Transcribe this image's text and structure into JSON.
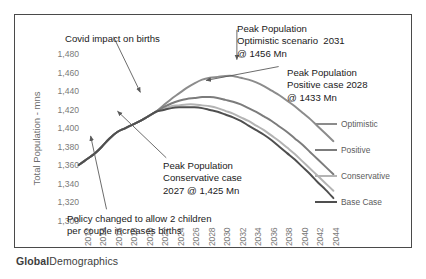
{
  "brand": {
    "bold": "Global",
    "regular": "Demographics"
  },
  "axes": {
    "y_title": "Total Population - mns",
    "y_ticks": [
      "1,480",
      "1,460",
      "1,440",
      "1,420",
      "1,400",
      "1,380",
      "1,360",
      "1,340",
      "1,320",
      "1,300"
    ],
    "x_ticks": [
      "2012",
      "2014",
      "2016",
      "2018",
      "2020",
      "2022",
      "2024",
      "2026",
      "2028",
      "2030",
      "2032",
      "2034",
      "2036",
      "2038",
      "2040",
      "2042",
      "2044"
    ]
  },
  "annotations": {
    "covid": "Covid impact on births",
    "optimistic": "Peak Population\nOptimistic scenario  2031\n@ 1456 Mn",
    "positive": "Peak Population\nPositive case 2028\n@ 1433 Mn",
    "conservative": "Peak Population\nConservative case\n2027 @ 1,425 Mn",
    "policy": "Policy changed to allow 2 children\nper couple increases births"
  },
  "legend": [
    {
      "label": "Optimistic",
      "color": "#8c8c8c"
    },
    {
      "label": "Positive",
      "color": "#7c7c7c"
    },
    {
      "label": "Conservative",
      "color": "#b4b4b4"
    },
    {
      "label": "Base Case",
      "color": "#4f4f4f"
    }
  ],
  "chart_data": {
    "type": "line",
    "title": "",
    "xlabel": "",
    "ylabel": "Total Population - mns",
    "xlim": [
      2012,
      2045
    ],
    "ylim": [
      1300,
      1490
    ],
    "grid": false,
    "legend_position": "right",
    "x": [
      2012,
      2013,
      2014,
      2015,
      2016,
      2017,
      2018,
      2019,
      2020,
      2021,
      2022,
      2023,
      2024,
      2025,
      2026,
      2027,
      2028,
      2029,
      2030,
      2031,
      2032,
      2033,
      2034,
      2035,
      2036,
      2037,
      2038,
      2039,
      2040,
      2041,
      2042,
      2043,
      2044,
      2045
    ],
    "series": [
      {
        "name": "Optimistic",
        "color": "#8c8c8c",
        "values": [
          1359,
          1365,
          1371,
          1379,
          1388,
          1395,
          1399,
          1403,
          1407,
          1412,
          1417,
          1424,
          1431,
          1437,
          1443,
          1448,
          1452,
          1454,
          1455,
          1456,
          1456,
          1454,
          1452,
          1449,
          1445,
          1440,
          1435,
          1429,
          1423,
          1416,
          1409,
          1401,
          1393,
          1385
        ]
      },
      {
        "name": "Positive",
        "color": "#7c7c7c",
        "values": [
          1359,
          1365,
          1371,
          1379,
          1388,
          1395,
          1399,
          1403,
          1407,
          1412,
          1417,
          1422,
          1426,
          1429,
          1431,
          1432,
          1433,
          1433,
          1432,
          1430,
          1428,
          1425,
          1421,
          1417,
          1412,
          1407,
          1401,
          1395,
          1388,
          1381,
          1373,
          1365,
          1357,
          1349
        ]
      },
      {
        "name": "Conservative",
        "color": "#b4b4b4",
        "values": [
          1359,
          1365,
          1371,
          1379,
          1388,
          1395,
          1399,
          1403,
          1407,
          1412,
          1417,
          1420,
          1423,
          1424,
          1425,
          1425,
          1424,
          1423,
          1421,
          1418,
          1415,
          1411,
          1407,
          1402,
          1397,
          1391,
          1385,
          1378,
          1371,
          1363,
          1355,
          1347,
          1339,
          1331
        ]
      },
      {
        "name": "Base Case",
        "color": "#4f4f4f",
        "values": [
          1359,
          1365,
          1371,
          1379,
          1388,
          1395,
          1399,
          1403,
          1407,
          1412,
          1417,
          1419,
          1421,
          1422,
          1422,
          1422,
          1421,
          1419,
          1417,
          1414,
          1411,
          1407,
          1402,
          1397,
          1392,
          1386,
          1379,
          1372,
          1365,
          1357,
          1349,
          1340,
          1332,
          1323
        ]
      }
    ],
    "peak_markers": [
      {
        "series": "Optimistic",
        "year": 2031,
        "value": 1456
      },
      {
        "series": "Positive",
        "year": 2028,
        "value": 1433
      },
      {
        "series": "Conservative",
        "year": 2027,
        "value": 1425
      }
    ]
  }
}
